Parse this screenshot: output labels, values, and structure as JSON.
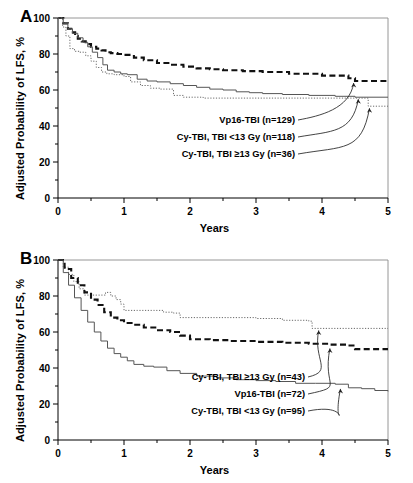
{
  "figure": {
    "title_a": "A",
    "title_b": "B",
    "axis": {
      "ylabel": "Adjusted Probability of LFS, %",
      "xlabel": "Years",
      "yticks": [
        "0",
        "20",
        "40",
        "60",
        "80",
        "100"
      ],
      "xticks": [
        "0",
        "1",
        "2",
        "3",
        "4",
        "5"
      ]
    }
  },
  "chart_data": [
    {
      "type": "line",
      "panel": "A",
      "title": "A",
      "xlabel": "Years",
      "ylabel": "Adjusted Probability of LFS, %",
      "xlim": [
        0,
        5
      ],
      "ylim": [
        0,
        100
      ],
      "xticks": [
        0,
        1,
        2,
        3,
        4,
        5
      ],
      "yticks": [
        0,
        20,
        40,
        60,
        80,
        100
      ],
      "minor_xticks": [
        0.5,
        1.5,
        2.5,
        3.5,
        4.5
      ],
      "minor_yticks": [
        10,
        30,
        50,
        70,
        90
      ],
      "grid": false,
      "legend": "annotations-with-leader-lines",
      "series": [
        {
          "name": "Vp16-TBI (n=129)",
          "style": "dashed",
          "n": 129,
          "final_value": 64,
          "x": [
            0,
            0.08,
            0.15,
            0.2,
            0.26,
            0.3,
            0.36,
            0.42,
            0.5,
            0.58,
            0.66,
            0.72,
            0.8,
            0.9,
            1.0,
            1.15,
            1.3,
            1.5,
            1.7,
            1.9,
            2.1,
            2.3,
            2.5,
            2.8,
            3.1,
            3.5,
            4.0,
            4.4,
            4.5,
            5.0
          ],
          "y": [
            100,
            97,
            94,
            92,
            90,
            88.5,
            87,
            85.5,
            84,
            83,
            82,
            81,
            80.5,
            80,
            79.5,
            78,
            76.5,
            75,
            74,
            73,
            72,
            71.5,
            71,
            70.5,
            70,
            69,
            68,
            66.5,
            65,
            64
          ]
        },
        {
          "name": "Cy-TBI, TBI <13 Gy (n=118)",
          "style": "solid",
          "n": 118,
          "final_value": 56,
          "x": [
            0,
            0.08,
            0.15,
            0.22,
            0.3,
            0.38,
            0.45,
            0.52,
            0.6,
            0.68,
            0.75,
            0.85,
            0.95,
            1.05,
            1.2,
            1.35,
            1.5,
            1.7,
            1.9,
            2.1,
            2.3,
            2.5,
            2.7,
            2.9,
            3.1,
            3.4,
            3.8,
            4.2,
            4.5,
            5.0
          ],
          "y": [
            100,
            97,
            94,
            91.5,
            89,
            86.5,
            84,
            81,
            78,
            74,
            71,
            70,
            69,
            68.5,
            66,
            65,
            64.5,
            63.5,
            62.5,
            61.5,
            60.5,
            60,
            59,
            58.5,
            58,
            57.5,
            57,
            56.5,
            56,
            56
          ]
        },
        {
          "name": "Cy-TBI, TBI ≥13 Gy (n=36)",
          "style": "dotted",
          "n": 36,
          "final_value": 51,
          "x": [
            0,
            0.07,
            0.12,
            0.18,
            0.25,
            0.33,
            0.42,
            0.5,
            0.58,
            0.66,
            0.74,
            0.85,
            1.0,
            1.1,
            1.25,
            1.4,
            1.55,
            1.75,
            1.9,
            2.2,
            2.6,
            3.0,
            3.4,
            3.8,
            4.2,
            4.6,
            4.7,
            5.0
          ],
          "y": [
            100,
            95,
            90,
            83,
            81.5,
            81,
            79,
            76,
            72.5,
            70,
            69,
            68.5,
            67.5,
            64.5,
            62.5,
            61,
            60.5,
            57,
            56,
            55.5,
            55.5,
            55.5,
            55.5,
            55.5,
            55.5,
            55.5,
            51,
            51
          ]
        }
      ],
      "annotations": [
        {
          "text": "Vp16-TBI (n=129)",
          "points_to_series": "Vp16-TBI (n=129)",
          "target_x": 4.48,
          "target_y": 65
        },
        {
          "text": "Cy-TBI, TBI <13 Gy (n=118)",
          "points_to_series": "Cy-TBI, TBI <13 Gy (n=118)",
          "target_x": 4.55,
          "target_y": 56
        },
        {
          "text": "Cy-TBI, TBI ≥13 Gy (n=36)",
          "points_to_series": "Cy-TBI, TBI ≥13 Gy (n=36)",
          "target_x": 4.72,
          "target_y": 51
        }
      ]
    },
    {
      "type": "line",
      "panel": "B",
      "title": "B",
      "xlabel": "Years",
      "ylabel": "Adjusted Probability of LFS, %",
      "xlim": [
        0,
        5
      ],
      "ylim": [
        0,
        100
      ],
      "xticks": [
        0,
        1,
        2,
        3,
        4,
        5
      ],
      "yticks": [
        0,
        20,
        40,
        60,
        80,
        100
      ],
      "minor_xticks": [
        0.5,
        1.5,
        2.5,
        3.5,
        4.5
      ],
      "minor_yticks": [
        10,
        30,
        50,
        70,
        90
      ],
      "grid": false,
      "legend": "annotations-with-leader-lines",
      "series": [
        {
          "name": "Cy-TBI, TBI ≥13 Gy (n=43)",
          "style": "dotted",
          "n": 43,
          "final_value": 62,
          "x": [
            0,
            0.08,
            0.16,
            0.24,
            0.32,
            0.4,
            0.52,
            0.62,
            0.72,
            0.8,
            0.88,
            0.95,
            1.0,
            1.2,
            1.45,
            1.6,
            1.75,
            1.85,
            2.2,
            2.6,
            3.0,
            3.4,
            3.8,
            3.85,
            4.3,
            5.0
          ],
          "y": [
            100,
            96,
            92,
            88,
            84,
            80.5,
            80.5,
            80.5,
            82,
            80,
            78,
            75.5,
            72,
            72,
            72,
            71,
            70.5,
            68,
            68,
            68,
            67.5,
            66.5,
            66,
            62,
            62,
            62
          ]
        },
        {
          "name": "Vp16-TBI (n=72)",
          "style": "dashed",
          "n": 72,
          "final_value": 50,
          "x": [
            0,
            0.1,
            0.2,
            0.3,
            0.4,
            0.5,
            0.6,
            0.7,
            0.8,
            0.9,
            1.0,
            1.15,
            1.3,
            1.5,
            1.7,
            1.85,
            2.0,
            2.3,
            2.6,
            3.0,
            3.4,
            3.8,
            4.1,
            4.4,
            4.5,
            5.0
          ],
          "y": [
            100,
            95,
            90,
            86,
            82,
            78,
            75,
            71,
            68,
            66.5,
            65,
            64,
            62.5,
            61,
            60,
            58,
            56,
            55.5,
            55,
            54.5,
            54,
            53.5,
            53,
            52.5,
            50.5,
            50.5
          ]
        },
        {
          "name": "Cy-TBI, TBI <13 Gy (n=95)",
          "style": "solid",
          "n": 95,
          "final_value": 27,
          "x": [
            0,
            0.08,
            0.16,
            0.25,
            0.35,
            0.45,
            0.55,
            0.65,
            0.75,
            0.85,
            0.95,
            1.05,
            1.15,
            1.3,
            1.45,
            1.5,
            1.65,
            1.85,
            2.1,
            2.4,
            2.7,
            3.0,
            3.3,
            3.6,
            3.9,
            4.2,
            4.4,
            4.6,
            4.8,
            5.0
          ],
          "y": [
            100,
            93,
            86,
            79,
            72,
            65.5,
            60,
            55,
            51,
            48,
            46,
            44,
            42,
            41,
            40.5,
            40.5,
            38.5,
            37,
            35.5,
            34.5,
            33.5,
            33,
            32.5,
            31.5,
            31.5,
            31,
            29,
            28.5,
            27.5,
            27
          ]
        }
      ],
      "annotations": [
        {
          "text": "Cy-TBI, TBI ≥13 Gy (n=43)",
          "points_to_series": "Cy-TBI, TBI ≥13 Gy (n=43)",
          "target_x": 3.95,
          "target_y": 62
        },
        {
          "text": "Vp16-TBI (n=72)",
          "points_to_series": "Vp16-TBI (n=72)",
          "target_x": 4.12,
          "target_y": 52
        },
        {
          "text": "Cy-TBI, TBI <13 Gy (n=95)",
          "points_to_series": "Cy-TBI, TBI <13 Gy (n=95)",
          "target_x": 4.28,
          "target_y": 29.5
        }
      ]
    }
  ]
}
